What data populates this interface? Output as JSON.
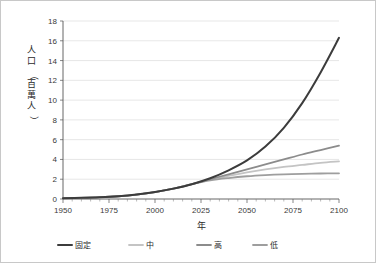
{
  "chart_data": {
    "type": "line",
    "title": "",
    "xlabel": "年",
    "ylabel": "人口（百萬人）",
    "xlim": [
      1950,
      2100
    ],
    "ylim": [
      0,
      18
    ],
    "grid": true,
    "legend_position": "bottom",
    "xticks": [
      "1950",
      "1975",
      "2000",
      "2025",
      "2050",
      "2075",
      "2100"
    ],
    "xtick_values": [
      1950,
      1975,
      2000,
      2025,
      2050,
      2075,
      2100
    ],
    "yticks": [
      "0",
      "2",
      "4",
      "6",
      "8",
      "10",
      "12",
      "14",
      "16",
      "18"
    ],
    "ytick_values": [
      0,
      2,
      4,
      6,
      8,
      10,
      12,
      14,
      16,
      18
    ],
    "x": [
      1950,
      1960,
      1970,
      1980,
      1990,
      2000,
      2010,
      2020,
      2030,
      2040,
      2050,
      2060,
      2070,
      2080,
      2090,
      2100
    ],
    "series": [
      {
        "name": "固定",
        "color": "#3c3c3c",
        "width": 2.0,
        "values": [
          0.08,
          0.12,
          0.18,
          0.28,
          0.45,
          0.7,
          1.05,
          1.5,
          2.1,
          2.9,
          3.9,
          5.3,
          7.2,
          9.7,
          12.8,
          16.3
        ]
      },
      {
        "name": "中",
        "color": "#c4c4c4",
        "width": 1.8,
        "values": [
          0.08,
          0.12,
          0.18,
          0.28,
          0.45,
          0.7,
          1.05,
          1.5,
          1.95,
          2.35,
          2.7,
          3.0,
          3.25,
          3.45,
          3.65,
          3.8
        ]
      },
      {
        "name": "高",
        "color": "#8c8c8c",
        "width": 1.8,
        "values": [
          0.08,
          0.12,
          0.18,
          0.28,
          0.45,
          0.7,
          1.05,
          1.5,
          2.0,
          2.5,
          3.0,
          3.5,
          4.0,
          4.5,
          4.95,
          5.4
        ]
      },
      {
        "name": "低",
        "color": "#9e9e9e",
        "width": 1.8,
        "values": [
          0.08,
          0.12,
          0.18,
          0.28,
          0.45,
          0.7,
          1.05,
          1.5,
          1.88,
          2.12,
          2.3,
          2.42,
          2.5,
          2.55,
          2.58,
          2.6
        ]
      }
    ],
    "legend": [
      {
        "label": "固定",
        "color": "#3c3c3c"
      },
      {
        "label": "中",
        "color": "#c4c4c4"
      },
      {
        "label": "高",
        "color": "#8c8c8c"
      },
      {
        "label": "低",
        "color": "#9e9e9e"
      }
    ]
  }
}
